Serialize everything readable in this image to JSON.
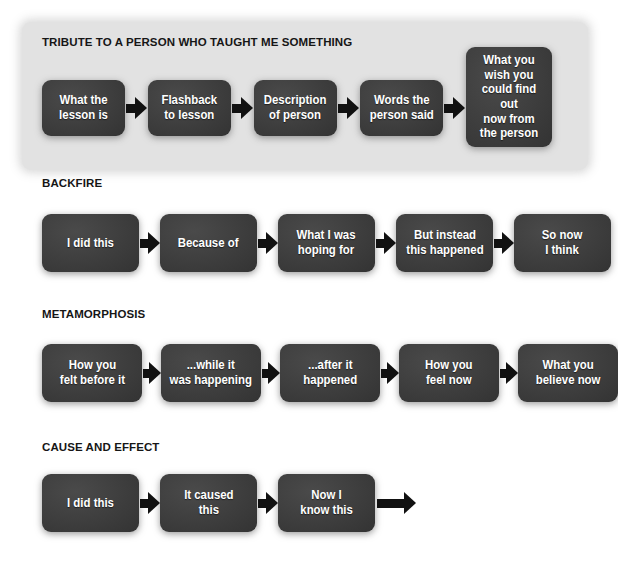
{
  "page": {
    "background_color": "#ffffff",
    "node_color": "#3e3e3e",
    "node_text_color": "#ffffff",
    "arrow_color": "#111111",
    "panel_color": "#e2e2e2",
    "label_color": "#161616"
  },
  "sections": [
    {
      "id": "tribute",
      "label": "TRIBUTE TO A PERSON WHO TAUGHT ME SOMETHING",
      "highlighted": true,
      "nodes": [
        {
          "lines": [
            "What the",
            "lesson is"
          ]
        },
        {
          "lines": [
            "Flashback",
            "to lesson"
          ]
        },
        {
          "lines": [
            "Description",
            "of person"
          ]
        },
        {
          "lines": [
            "Words the",
            "person said"
          ]
        },
        {
          "lines": [
            "What you",
            "wish you",
            "could find out",
            "now from",
            "the person"
          ]
        }
      ],
      "trailing_arrow": false
    },
    {
      "id": "backfire",
      "label": "BACKFIRE",
      "highlighted": false,
      "nodes": [
        {
          "lines": [
            "I did this"
          ]
        },
        {
          "lines": [
            "Because of"
          ]
        },
        {
          "lines": [
            "What I was",
            "hoping for"
          ]
        },
        {
          "lines": [
            "But instead",
            "this happened"
          ]
        },
        {
          "lines": [
            "So now",
            "I think"
          ]
        }
      ],
      "trailing_arrow": false
    },
    {
      "id": "metamorphosis",
      "label": "METAMORPHOSIS",
      "highlighted": false,
      "nodes": [
        {
          "lines": [
            "How you",
            "felt before it"
          ]
        },
        {
          "lines": [
            "...while it",
            "was happening"
          ]
        },
        {
          "lines": [
            "...after it",
            "happened"
          ]
        },
        {
          "lines": [
            "How you",
            "feel now"
          ]
        },
        {
          "lines": [
            "What you",
            "believe now"
          ]
        }
      ],
      "trailing_arrow": false
    },
    {
      "id": "cause-and-effect",
      "label": "CAUSE AND EFFECT",
      "highlighted": false,
      "nodes": [
        {
          "lines": [
            "I did this"
          ]
        },
        {
          "lines": [
            "It caused",
            "this"
          ]
        },
        {
          "lines": [
            "Now I",
            "know this"
          ]
        }
      ],
      "trailing_arrow": true
    }
  ]
}
